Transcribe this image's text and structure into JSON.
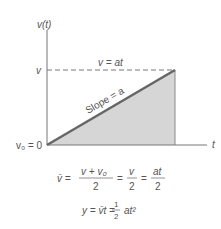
{
  "diagram": {
    "y_axis_label": "v(t)",
    "x_axis_label": "t",
    "v_level_label": "v",
    "origin_label": "v₀ = 0",
    "dashed_line_label": "v = at",
    "slope_label": "Slope = a",
    "colors": {
      "axis": "#777777",
      "slope_line": "#666666",
      "fill": "#d6d6d6",
      "text": "#555555"
    }
  },
  "equations": {
    "eq1": {
      "lhs": "v̄ =",
      "frac1_num": "v + v₀",
      "frac1_den": "2",
      "eq": "=",
      "frac2_num": "v",
      "frac2_den": "2",
      "eq2": "=",
      "frac3_num": "at",
      "frac3_den": "2"
    },
    "eq2": {
      "lhs": "y = v̄t =",
      "frac_num": "1",
      "frac_den": "2",
      "rhs": "at²"
    }
  }
}
